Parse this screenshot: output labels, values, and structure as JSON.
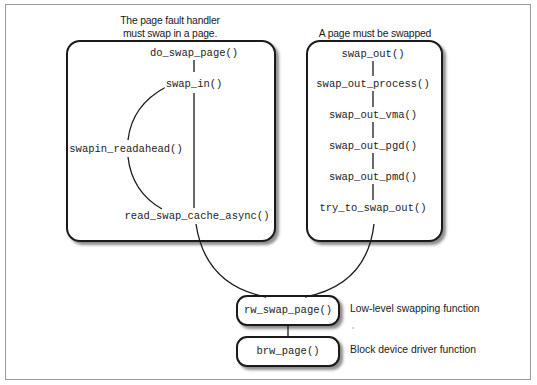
{
  "diagram": {
    "left_panel": {
      "caption_line1": "The page fault handler",
      "caption_line2": "must swap in a page.",
      "functions": {
        "do_swap_page": "do_swap_page()",
        "swap_in": "swap_in()",
        "swapin_readahead": "swapin_readahead()",
        "read_swap_cache_async": "read_swap_cache_async()"
      }
    },
    "right_panel": {
      "caption": "A page must be swapped out.",
      "functions": [
        "swap_out()",
        "swap_out_process()",
        "swap_out_vma()",
        "swap_out_pgd()",
        "swap_out_pmd()",
        "try_to_swap_out()"
      ]
    },
    "bottom": {
      "rw_swap_page": "rw_swap_page()",
      "rw_swap_page_note": "Low-level swapping function",
      "brw_page": "brw_page()",
      "brw_page_note": "Block device driver function"
    }
  }
}
